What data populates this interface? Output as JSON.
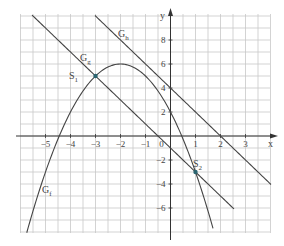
{
  "chart_data": {
    "type": "line",
    "title": "",
    "xlabel": "x",
    "ylabel": "y",
    "xlim": [
      -6,
      4
    ],
    "ylim": [
      -8,
      10
    ],
    "grid": true,
    "x_ticks": [
      -5,
      -4,
      -3,
      -2,
      -1,
      0,
      1,
      2,
      3
    ],
    "y_ticks": [
      8,
      6,
      4,
      2,
      0,
      -2,
      -4,
      -6
    ],
    "origin_label": "0",
    "series": [
      {
        "name": "G_f",
        "label_main": "G",
        "label_sub": "f",
        "kind": "parabola",
        "equation": "f(x) = -x^2 - 4x + 2",
        "coeffs": {
          "a": -1,
          "b": -4,
          "c": 2
        },
        "x_range": [
          -5.75,
          1.7
        ],
        "vertex": [
          -2,
          6
        ],
        "color": "#444444"
      },
      {
        "name": "G_g",
        "label_main": "G",
        "label_sub": "g",
        "kind": "line",
        "equation": "g(x) = -2x - 1",
        "slope": -2,
        "intercept": -1,
        "x_range": [
          -5.54,
          2.54
        ],
        "color": "#444444"
      },
      {
        "name": "G_h",
        "label_main": "G",
        "label_sub": "h",
        "kind": "line",
        "equation": "h(x) = -2x + 4",
        "slope": -2,
        "intercept": 4,
        "x_range": [
          -3.02,
          4.02
        ],
        "color": "#444444"
      }
    ],
    "points": [
      {
        "name": "S1",
        "label_main": "S",
        "label_sub": "1",
        "x": -3,
        "y": 5,
        "color": "#2a6470"
      },
      {
        "name": "S2",
        "label_main": "S",
        "label_sub": "2",
        "x": 1,
        "y": -3,
        "color": "#2a6470"
      }
    ]
  },
  "colors": {
    "grid": "#c8c8c8",
    "axis": "#333333",
    "curve": "#444444",
    "point": "#2a6470"
  }
}
